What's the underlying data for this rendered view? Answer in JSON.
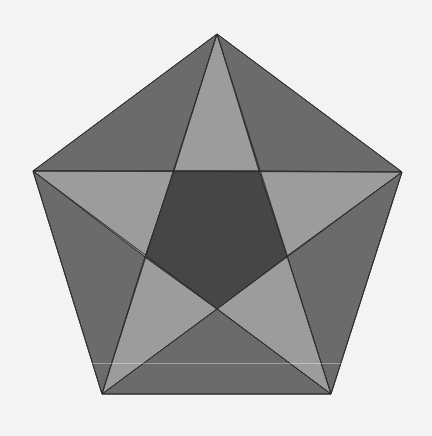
{
  "figure": {
    "background_color": "#f3f3f3",
    "stroke_color": "#2e2e2e",
    "stroke_width": 1,
    "colors": {
      "inner_pentagon": "#464646",
      "star_points": "#9c9c9c",
      "outer_triangles": "#6b6b6b"
    },
    "outer_vertices": {
      "top": [
        217,
        34
      ],
      "right": [
        402,
        172
      ],
      "bottom_right": [
        331,
        394
      ],
      "bottom_left": [
        102,
        394
      ],
      "left": [
        33,
        171
      ]
    },
    "inner_vertices": {
      "top_left": [
        174,
        171
      ],
      "top_right": [
        259,
        171
      ],
      "right": [
        287,
        256
      ],
      "bottom": [
        217,
        309
      ],
      "left": [
        145,
        257
      ]
    },
    "regions": {
      "inner_pentagon": "174,171 259,171 287,256 217,309 145,257",
      "star_points": [
        {
          "name": "star-point-top",
          "points": "217,34 259,171 174,171"
        },
        {
          "name": "star-point-right",
          "points": "402,172 287,256 259,171"
        },
        {
          "name": "star-point-bottom-right",
          "points": "331,394 217,309 287,256"
        },
        {
          "name": "star-point-bottom-left",
          "points": "102,394 145,257 217,309"
        },
        {
          "name": "star-point-left",
          "points": "33,171 174,171 145,257"
        }
      ],
      "outer_triangles": [
        {
          "name": "outer-triangle-top-right",
          "points": "217,34 402,172 259,171"
        },
        {
          "name": "outer-triangle-right",
          "points": "402,172 331,394 287,256"
        },
        {
          "name": "outer-triangle-bottom",
          "points": "331,394 102,394 217,309"
        },
        {
          "name": "outer-triangle-left",
          "points": "102,394 33,171 145,257"
        },
        {
          "name": "outer-triangle-top-left",
          "points": "33,171 217,34 174,171"
        }
      ],
      "outer_pentagon": "217,34 402,172 331,394 102,394 33,171",
      "pentagram": "217,34 331,394 33,171 402,172 102,394"
    }
  }
}
